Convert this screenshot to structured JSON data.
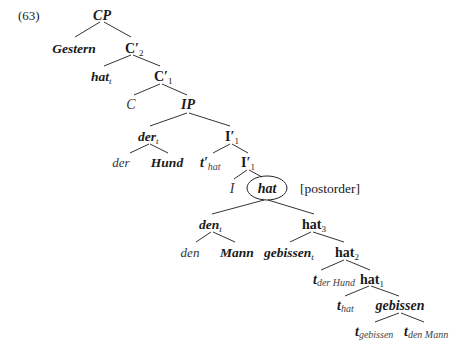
{
  "example_number": "(63)",
  "annotation": "[postorder]",
  "nodes": {
    "cp": {
      "label": "CP"
    },
    "gestern": {
      "label": "Gestern"
    },
    "c2": {
      "label": "C′",
      "sub": "2"
    },
    "hat_t": {
      "label": "hat",
      "sub": "t"
    },
    "c1": {
      "label": "C′",
      "sub": "1"
    },
    "c": {
      "label": "C"
    },
    "ip": {
      "label": "IP"
    },
    "der_t": {
      "label": "der",
      "sub": "t"
    },
    "i1_top": {
      "label": "I′",
      "sub": "1"
    },
    "der": {
      "label": "der"
    },
    "hund": {
      "label": "Hund"
    },
    "tprime_hat": {
      "label": "t′",
      "sub": "hat"
    },
    "i1_low": {
      "label": "I′",
      "sub": "1"
    },
    "i": {
      "label": "I"
    },
    "hat_circled": {
      "label": "hat"
    },
    "den_t": {
      "label": "den",
      "sub": "t"
    },
    "hat3": {
      "label": "hat",
      "sub": "3"
    },
    "den": {
      "label": "den"
    },
    "mann": {
      "label": "Mann"
    },
    "gebissen_t": {
      "label": "gebissen",
      "sub": "t"
    },
    "hat2": {
      "label": "hat",
      "sub": "2"
    },
    "t_derhund": {
      "label": "t",
      "sub": "der Hund"
    },
    "hat1": {
      "label": "hat",
      "sub": "1"
    },
    "t_hat": {
      "label": "t",
      "sub": "hat"
    },
    "gebissen": {
      "label": "gebissen"
    },
    "t_gebissen": {
      "label": "t",
      "sub": "gebissen"
    },
    "t_denmann": {
      "label": "t",
      "sub": "den Mann"
    }
  }
}
